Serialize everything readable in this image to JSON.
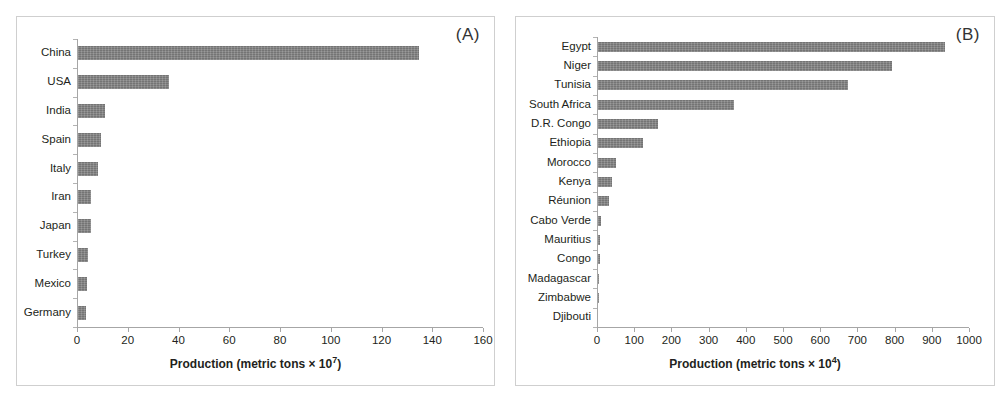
{
  "figure": {
    "background": "#ffffff",
    "bar_color": "#7f7f7f",
    "axis_color": "#a6a6a6"
  },
  "panels": [
    {
      "tag": "(A)",
      "axis_title_prefix": "Production (metric tons × 10",
      "axis_title_exponent": "7",
      "axis_title_suffix": ")"
    },
    {
      "tag": "(B)",
      "axis_title_prefix": "Production (metric tons × 10",
      "axis_title_exponent": "4",
      "axis_title_suffix": ")"
    }
  ],
  "chart_data": [
    {
      "type": "bar",
      "orientation": "horizontal",
      "panel": "(A)",
      "title": "",
      "xlabel": "Production (metric tons × 10^7)",
      "ylabel": "",
      "xlim": [
        0,
        160
      ],
      "xticks": [
        0,
        20,
        40,
        60,
        80,
        100,
        120,
        140,
        160
      ],
      "xticklabels": [
        "0",
        "20",
        "40",
        "60",
        "80",
        "100",
        "120",
        "140",
        "160"
      ],
      "grid": false,
      "legend": null,
      "categories": [
        "China",
        "USA",
        "India",
        "Spain",
        "Italy",
        "Iran",
        "Japan",
        "Turkey",
        "Mexico",
        "Germany"
      ],
      "values": [
        134.5,
        35.8,
        10.6,
        9.0,
        8.0,
        5.0,
        5.2,
        3.8,
        3.6,
        3.2
      ]
    },
    {
      "type": "bar",
      "orientation": "horizontal",
      "panel": "(B)",
      "title": "",
      "xlabel": "Production (metric tons × 10^4)",
      "ylabel": "",
      "xlim": [
        0,
        1000
      ],
      "xticks": [
        0,
        100,
        200,
        300,
        400,
        500,
        600,
        700,
        800,
        900,
        1000
      ],
      "xticklabels": [
        "0",
        "100",
        "200",
        "300",
        "400",
        "500",
        "600",
        "700",
        "800",
        "900",
        "1000"
      ],
      "grid": false,
      "legend": null,
      "categories": [
        "Egypt",
        "Niger",
        "Tunisia",
        "South Africa",
        "D.R. Congo",
        "Ethiopia",
        "Morocco",
        "Kenya",
        "Réunion",
        "Cabo Verde",
        "Mauritius",
        "Congo",
        "Madagascar",
        "Zimbabwe",
        "Djibouti"
      ],
      "values": [
        934,
        790,
        672,
        366,
        160,
        121,
        48,
        38,
        30,
        7,
        5,
        5,
        1.2,
        0.8,
        0.4
      ]
    }
  ]
}
